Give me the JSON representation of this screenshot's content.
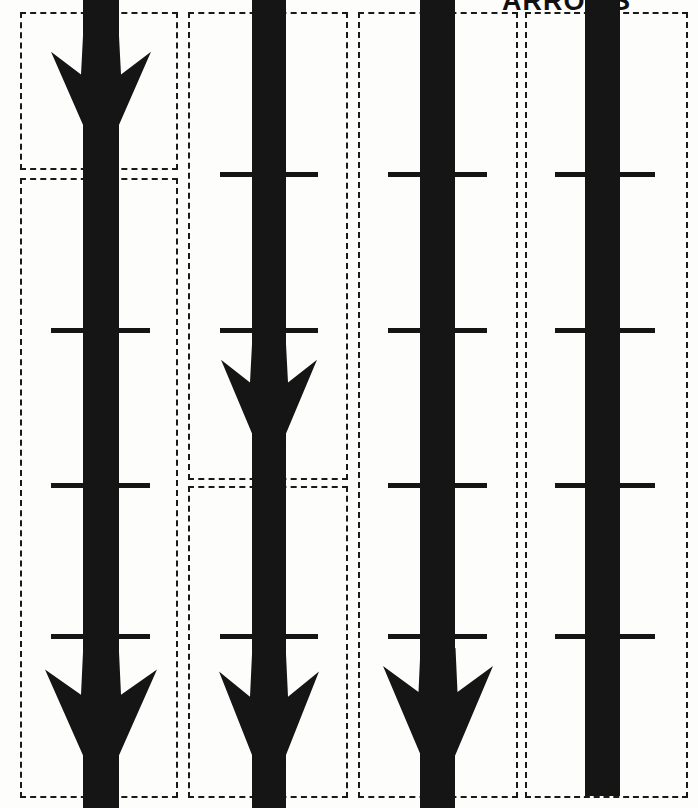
{
  "page": {
    "title": "ARROWS",
    "background_color": "#fdfdfc",
    "ink_color": "#151515",
    "dash_color": "#1a1a1a",
    "width": 698,
    "height": 808
  },
  "diagram": {
    "type": "annotated-scan",
    "column_count": 4,
    "tick_row_count": 4,
    "columns": [
      {
        "id": "column-1",
        "label": "Arrow 1",
        "shaft": {
          "x": 83,
          "width": 36,
          "top": 0,
          "bottom": 808
        },
        "heads": [
          {
            "position": "upper",
            "tip_y": 166,
            "base_y": 36,
            "half_width": 50
          },
          {
            "position": "bottom",
            "tip_y": 796,
            "base_y": 652,
            "half_width": 56
          }
        ],
        "ticks": [
          328,
          483,
          634
        ],
        "tick_x": 51,
        "tick_width": 99,
        "segments": [
          {
            "x": 20,
            "y": 12,
            "w": 158,
            "h": 158
          },
          {
            "x": 20,
            "y": 178,
            "w": 158,
            "h": 620
          }
        ]
      },
      {
        "id": "column-2",
        "label": "Arrow 2",
        "shaft": {
          "x": 252,
          "width": 34,
          "top": 0,
          "bottom": 808
        },
        "heads": [
          {
            "position": "middle",
            "tip_y": 474,
            "base_y": 344,
            "half_width": 48
          },
          {
            "position": "bottom",
            "tip_y": 798,
            "base_y": 654,
            "half_width": 50
          }
        ],
        "ticks": [
          172,
          328,
          634
        ],
        "tick_x": 220,
        "tick_width": 98,
        "segments": [
          {
            "x": 188,
            "y": 12,
            "w": 160,
            "h": 468
          },
          {
            "x": 188,
            "y": 486,
            "w": 160,
            "h": 312
          }
        ]
      },
      {
        "id": "column-3",
        "label": "Arrow 3",
        "shaft": {
          "x": 420,
          "width": 35,
          "top": 0,
          "bottom": 808
        },
        "heads": [
          {
            "position": "bottom",
            "tip_y": 796,
            "base_y": 648,
            "half_width": 55
          }
        ],
        "ticks": [
          172,
          328,
          483,
          634
        ],
        "tick_x": 388,
        "tick_width": 99,
        "segments": [
          {
            "x": 358,
            "y": 12,
            "w": 160,
            "h": 786
          }
        ]
      },
      {
        "id": "column-4",
        "label": "Arrow 4",
        "shaft": {
          "x": 585,
          "width": 35,
          "top": 0,
          "bottom": 796
        },
        "heads": [],
        "ticks": [
          172,
          328,
          483,
          634
        ],
        "tick_x": 555,
        "tick_width": 100,
        "segments": [
          {
            "x": 525,
            "y": 12,
            "w": 163,
            "h": 786
          }
        ]
      }
    ]
  }
}
